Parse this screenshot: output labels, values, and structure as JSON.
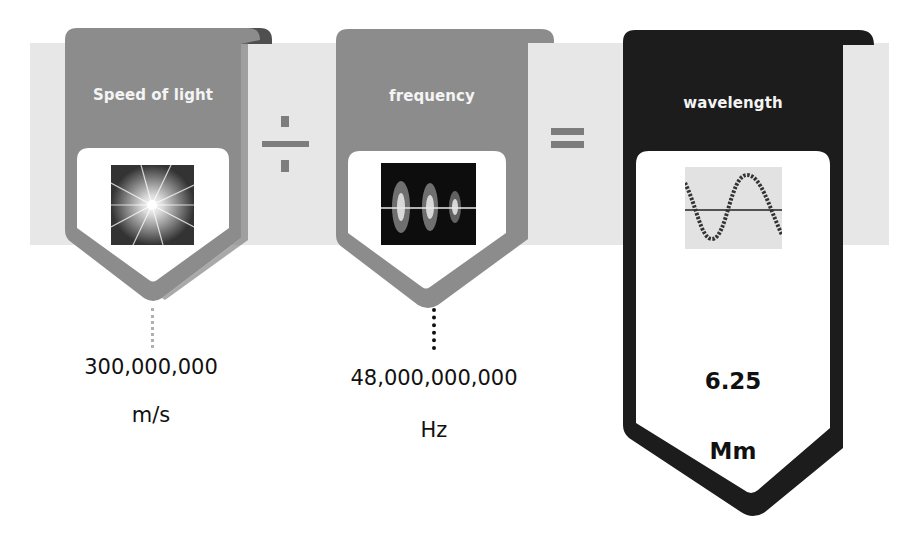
{
  "equation": {
    "operator_divide": "÷",
    "operator_equals": "="
  },
  "cards": [
    {
      "title": "Speed of light",
      "icon": "starburst-light-image",
      "value": "300,000,000",
      "unit": "m/s",
      "color": "#8c8c8c"
    },
    {
      "title": "frequency",
      "icon": "waveform-image",
      "value": "48,000,000,000",
      "unit": "Hz",
      "color": "#8c8c8c"
    },
    {
      "title": "wavelength",
      "icon": "sine-wave-image",
      "value": "6.25",
      "unit": "Mm",
      "color": "#1c1c1c"
    }
  ],
  "colors": {
    "band": "#e7e7e7",
    "gray_card": "#8c8c8c",
    "gray_fold": "#5e5e5e",
    "dark_card": "#1c1c1c",
    "operator": "#7d7d7d"
  }
}
